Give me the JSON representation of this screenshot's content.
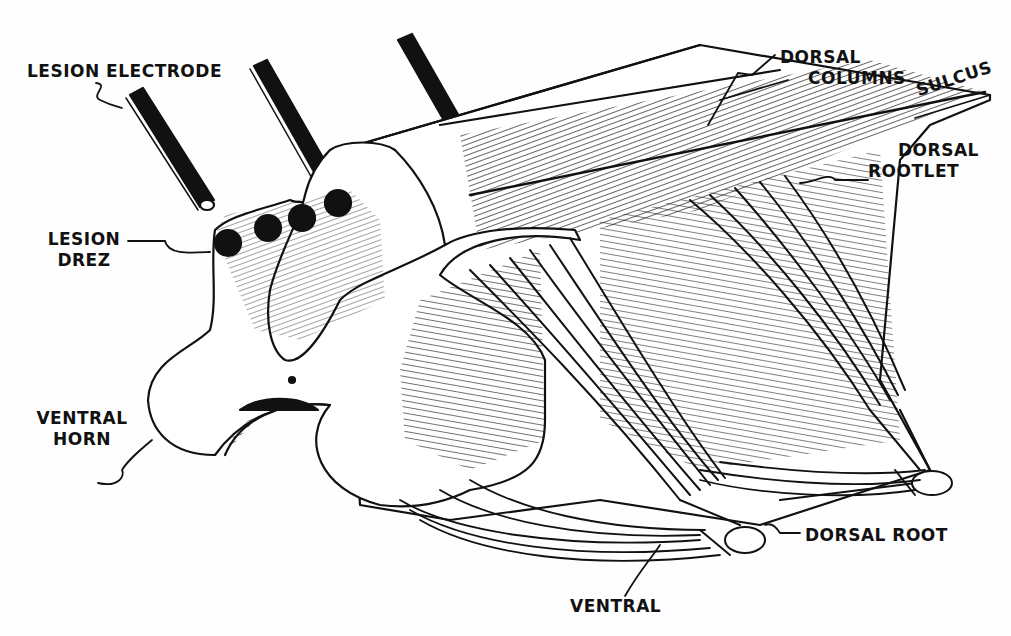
{
  "diagram": {
    "type": "anatomical-illustration",
    "colors": {
      "ink": "#111111",
      "paper": "#fefefe"
    },
    "labels": {
      "lesion_electrode": "LESION ELECTRODE",
      "lesion_drez_line1": "LESION",
      "lesion_drez_line2": "DREZ",
      "ventral_horn_line1": "VENTRAL",
      "ventral_horn_line2": "HORN",
      "dorsal_columns_line1": "DORSAL",
      "dorsal_columns_line2": "COLUMNS",
      "sulcus": "SULCUS",
      "dorsal_rootlet_line1": "DORSAL",
      "dorsal_rootlet_line2": "ROOTLET",
      "dorsal_root": "DORSAL ROOT",
      "ventral": "VENTRAL"
    },
    "elements": [
      "lesion-electrode-1",
      "lesion-electrode-2",
      "lesion-electrode-3",
      "spinal-cord-segment",
      "gray-matter-section",
      "dorsal-rootlets",
      "ventral-rootlets",
      "dorsal-root-bundle",
      "ventral-root-bundle"
    ]
  }
}
